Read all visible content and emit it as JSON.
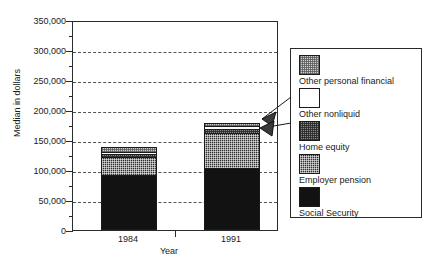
{
  "chart_data": {
    "type": "bar",
    "subtype": "stacked-bar",
    "title": "",
    "xlabel": "Year",
    "ylabel": "Median in dollars",
    "categories": [
      "1984",
      "1991"
    ],
    "ylim": [
      0,
      350000
    ],
    "yticks": [
      0,
      50000,
      100000,
      150000,
      200000,
      250000,
      300000,
      350000
    ],
    "ytick_labels": [
      "0",
      "50,000",
      "100,000",
      "150,000",
      "200,000",
      "250,000",
      "300,000",
      "350,000"
    ],
    "minor_ticks": true,
    "grid": "horizontal-dashed",
    "legend_position": "right-outside",
    "series": [
      {
        "name": "Social Security",
        "values": [
          91000,
          103000
        ],
        "fill": "solid-black"
      },
      {
        "name": "Employer pension",
        "values": [
          31000,
          58000
        ],
        "fill": "dark-checker"
      },
      {
        "name": "Home equity",
        "values": [
          5000,
          8000
        ],
        "fill": "mid-checker"
      },
      {
        "name": "Other nonliquid",
        "values": [
          3000,
          4000
        ],
        "fill": "white"
      },
      {
        "name": "Other personal financial",
        "values": [
          8000,
          6000
        ],
        "fill": "light-checker"
      }
    ],
    "totals": [
      138000,
      179000
    ],
    "annotations": [
      {
        "text": "leader-arrow to Other personal financial segment of 1991 bar"
      },
      {
        "text": "leader-arrow to Other nonliquid segment of 1991 bar"
      }
    ]
  },
  "legend": {
    "items": [
      {
        "label": "Other personal financial",
        "swatch": "light-checker"
      },
      {
        "label": "Other nonliquid",
        "swatch": "white"
      },
      {
        "label": "Home equity",
        "swatch": "mid-checker"
      },
      {
        "label": "Employer pension",
        "swatch": "dark-checker"
      },
      {
        "label": "Social Security",
        "swatch": "solid-black"
      }
    ]
  },
  "colors": {
    "axis": "#2b2b2b",
    "grid": "#555555",
    "social_security": "#121212",
    "employer_pension": "#2e2e2e",
    "home_equity": "#8a8a8a",
    "other_nonliquid": "#ffffff",
    "other_personal_financial": "#cfcfcf"
  }
}
